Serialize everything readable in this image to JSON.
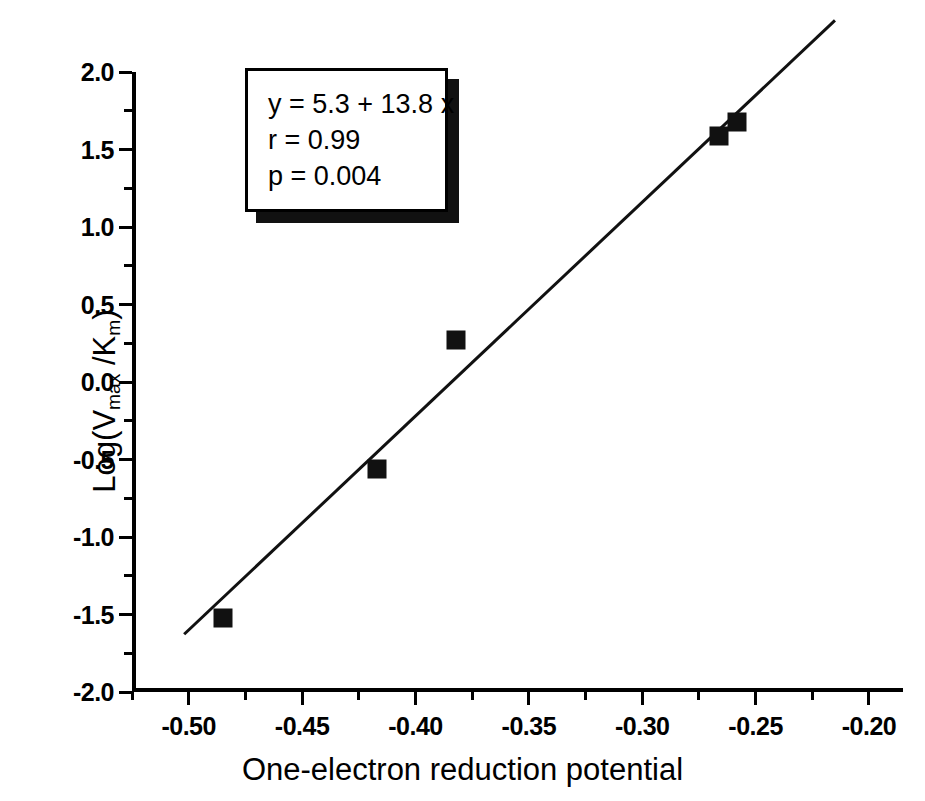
{
  "chart_data": {
    "type": "scatter",
    "title": "",
    "xlabel": "One-electron reduction potential",
    "ylabel": "Log(Vmax /Km)",
    "ylabel_parts": {
      "prefix": "Log(V",
      "sub1": "max",
      "mid": " /K",
      "sub2": "m",
      "suffix": ")"
    },
    "xlim": [
      -0.525,
      -0.185
    ],
    "ylim": [
      -2.0,
      2.0
    ],
    "xticks": [
      -0.5,
      -0.45,
      -0.4,
      -0.35,
      -0.3,
      -0.25,
      -0.2
    ],
    "xticklabels": [
      "-0.50",
      "-0.45",
      "-0.40",
      "-0.35",
      "-0.30",
      "-0.25",
      "-0.20"
    ],
    "xminor_step": 0.025,
    "yticks": [
      -2.0,
      -1.5,
      -1.0,
      -0.5,
      0.0,
      0.5,
      1.0,
      1.5,
      2.0
    ],
    "yticklabels": [
      "-2.0",
      "-1.5",
      "-1.0",
      "-0.5",
      "0.0",
      "0.5",
      "1.0",
      "1.5",
      "2.0"
    ],
    "yminor_step": 0.25,
    "grid": false,
    "legend": false,
    "marker": "filled-square",
    "marker_color": "#111111",
    "line_color": "#111111",
    "points": [
      {
        "x": -0.485,
        "y": -1.52
      },
      {
        "x": -0.417,
        "y": -0.56
      },
      {
        "x": -0.382,
        "y": 0.27
      },
      {
        "x": -0.266,
        "y": 1.59
      },
      {
        "x": -0.258,
        "y": 1.68
      }
    ],
    "fit_line": {
      "slope": 13.8,
      "intercept": 5.3,
      "x_start": -0.502,
      "x_end": -0.215
    },
    "annotation": {
      "equation": "y = 5.3 + 13.8 x",
      "correlation": "r = 0.99",
      "pvalue": "p = 0.004"
    }
  },
  "colors": {
    "background": "#ffffff",
    "foreground": "#000000",
    "marker": "#111111"
  }
}
